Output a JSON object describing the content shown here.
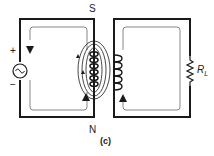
{
  "diagram": {
    "type": "transformer-magnetic-circuit",
    "caption": "(c)",
    "labels": {
      "south_pole": "S",
      "north_pole": "N",
      "source_plus": "+",
      "source_minus": "−",
      "load_resistor": "R",
      "load_resistor_sub": "L"
    },
    "components": [
      {
        "name": "ac-source",
        "symbol": "~",
        "position": "left leg of left core"
      },
      {
        "name": "primary-coil",
        "position": "right leg of left core"
      },
      {
        "name": "secondary-coil",
        "position": "left leg of right core"
      },
      {
        "name": "load-resistor",
        "label": "RL",
        "position": "right leg of right core"
      }
    ],
    "colors": {
      "core_outline": "#1a1a1a",
      "flux_path": "#888888",
      "background": "#ffffff"
    }
  }
}
